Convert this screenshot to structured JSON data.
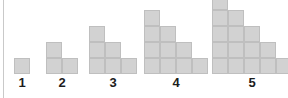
{
  "figure": {
    "background_color": "#ffffff",
    "rule_color": "#c9c9c9",
    "cell_fill_color": "#d2d2d2",
    "cell_border_color": "#bfbfbf",
    "label_color": "#1c1c1c",
    "cell_size_px": 16,
    "baseline_y_px": 74
  },
  "chart_data": {
    "type": "bar",
    "title": "",
    "subtitle": "",
    "xlabel": "",
    "ylabel": "",
    "grid": false,
    "legend": null,
    "categories": [
      "1",
      "2",
      "3",
      "4",
      "5"
    ],
    "values": [
      1,
      3,
      6,
      10,
      15
    ],
    "value_name": "total squares",
    "figures": [
      {
        "label": "1",
        "left_px": 14,
        "column_heights": [
          1
        ],
        "total_squares": 1,
        "max_height": 1
      },
      {
        "label": "2",
        "left_px": 46,
        "column_heights": [
          2,
          1
        ],
        "total_squares": 3,
        "max_height": 2
      },
      {
        "label": "3",
        "left_px": 89,
        "column_heights": [
          3,
          2,
          1
        ],
        "total_squares": 6,
        "max_height": 3
      },
      {
        "label": "4",
        "left_px": 144,
        "column_heights": [
          4,
          3,
          2,
          1
        ],
        "total_squares": 10,
        "max_height": 4
      },
      {
        "label": "5",
        "left_px": 212,
        "column_heights": [
          5,
          4,
          3,
          2,
          1
        ],
        "total_squares": 15,
        "max_height": 5
      }
    ]
  }
}
